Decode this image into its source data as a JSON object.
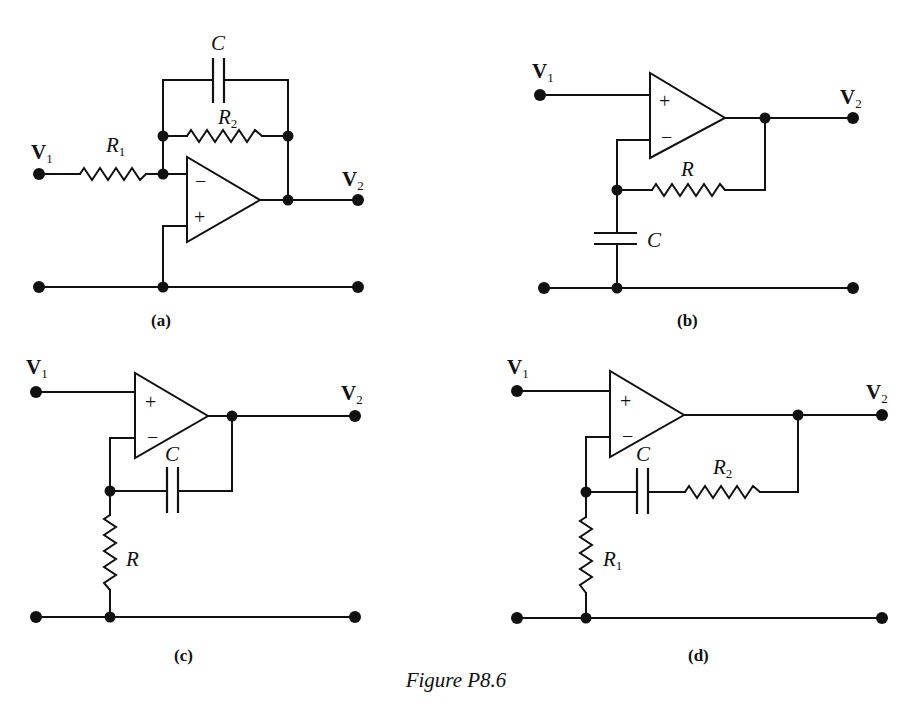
{
  "figure": {
    "caption": "Figure P8.6",
    "panels": [
      {
        "id": "a",
        "label": "(a)",
        "input_label": "V",
        "input_sub": "1",
        "output_label": "V",
        "output_sub": "2",
        "components": [
          {
            "type": "resistor",
            "name": "R",
            "sub": "1",
            "placement": "series input to inverting node"
          },
          {
            "type": "resistor",
            "name": "R",
            "sub": "2",
            "placement": "feedback, parallel with C"
          },
          {
            "type": "capacitor",
            "name": "C",
            "sub": "",
            "placement": "feedback, parallel with R2"
          }
        ],
        "opamp": {
          "top_input": "−",
          "bottom_input": "+"
        }
      },
      {
        "id": "b",
        "label": "(b)",
        "input_label": "V",
        "input_sub": "1",
        "output_label": "V",
        "output_sub": "2",
        "components": [
          {
            "type": "resistor",
            "name": "R",
            "sub": "",
            "placement": "feedback from output to inverting node"
          },
          {
            "type": "capacitor",
            "name": "C",
            "sub": "",
            "placement": "inverting node to ground"
          }
        ],
        "opamp": {
          "top_input": "+",
          "bottom_input": "−"
        }
      },
      {
        "id": "c",
        "label": "(c)",
        "input_label": "V",
        "input_sub": "1",
        "output_label": "V",
        "output_sub": "2",
        "components": [
          {
            "type": "capacitor",
            "name": "C",
            "sub": "",
            "placement": "feedback from output to inverting node"
          },
          {
            "type": "resistor",
            "name": "R",
            "sub": "",
            "placement": "inverting node to ground"
          }
        ],
        "opamp": {
          "top_input": "+",
          "bottom_input": "−"
        }
      },
      {
        "id": "d",
        "label": "(d)",
        "input_label": "V",
        "input_sub": "1",
        "output_label": "V",
        "output_sub": "2",
        "components": [
          {
            "type": "capacitor",
            "name": "C",
            "sub": "",
            "placement": "feedback, series with R2"
          },
          {
            "type": "resistor",
            "name": "R",
            "sub": "2",
            "placement": "feedback, series with C"
          },
          {
            "type": "resistor",
            "name": "R",
            "sub": "1",
            "placement": "inverting node to ground"
          }
        ],
        "opamp": {
          "top_input": "+",
          "bottom_input": "−"
        }
      }
    ]
  }
}
